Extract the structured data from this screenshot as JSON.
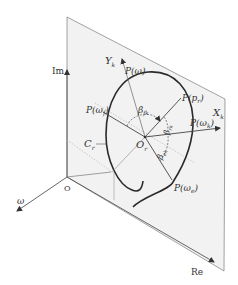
{
  "diagram": {
    "type": "nyquist-plane-3d",
    "axes": {
      "im": "Im",
      "re": "Re",
      "omega": "ω",
      "origin": "O"
    },
    "local_axes": {
      "x": {
        "base": "X",
        "sub": "k"
      },
      "y": {
        "base": "Y",
        "sub": "k"
      }
    },
    "center": {
      "base": "O",
      "sub": "r"
    },
    "curve_label": {
      "base": "C",
      "sub": "r"
    },
    "points": [
      {
        "id": "P_omega",
        "base": "P(ω)",
        "sub": ""
      },
      {
        "id": "P_omega_f",
        "base": "P(ω",
        "sub": "f",
        "close": ")"
      },
      {
        "id": "P_p_r",
        "base": "P(p",
        "sub": "r",
        "close": ")"
      },
      {
        "id": "P_omega_k",
        "base": "P(ω",
        "sub": "k",
        "close": ")"
      },
      {
        "id": "P_omega_e",
        "base": "P(ω",
        "sub": "e",
        "close": ")"
      }
    ],
    "angles": [
      {
        "id": "beta_fk",
        "base": "β",
        "sub": "fk"
      },
      {
        "id": "beta_rk",
        "base": "β",
        "sub": "rk"
      },
      {
        "id": "beta_ek",
        "base": "β",
        "sub": "ek"
      }
    ],
    "colors": {
      "plane_fill": "#f2f2f2",
      "plane_edge": "#8a8a8a",
      "curve": "#2a2a2a",
      "axis": "#555555",
      "dotted": "#b8b8b8",
      "text": "#333333"
    }
  }
}
